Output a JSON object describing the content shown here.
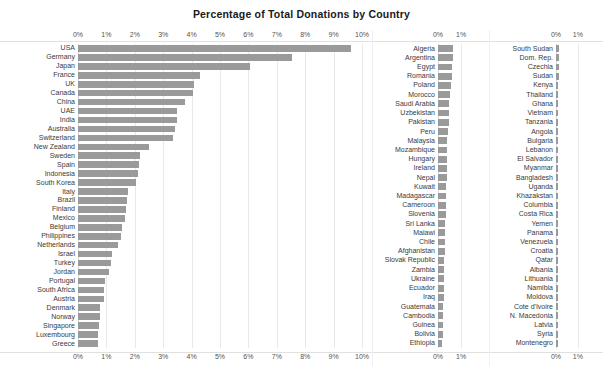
{
  "chart_data": {
    "type": "bar",
    "orientation": "horizontal",
    "title": "Percentage of Total Donations by Country",
    "xlabel": "",
    "ylabel": "",
    "grid": true,
    "legend": null,
    "value_suffix": "%",
    "panels": [
      {
        "name": "panel-left",
        "xlim": [
          0,
          10
        ],
        "ticks": [
          0,
          1,
          2,
          3,
          4,
          5,
          6,
          7,
          8,
          9,
          10
        ],
        "tick_labels": [
          "0%",
          "1%",
          "2%",
          "3%",
          "4%",
          "5%",
          "6%",
          "7%",
          "8%",
          "9%",
          "10%"
        ],
        "categories": [
          "USA",
          "Germany",
          "Japan",
          "France",
          "UK",
          "Canada",
          "China",
          "UAE",
          "India",
          "Australia",
          "Switzerland",
          "New Zealand",
          "Sweden",
          "Spain",
          "Indonesia",
          "South Korea",
          "Italy",
          "Brazil",
          "Finland",
          "Mexico",
          "Belgium",
          "Philippines",
          "Netherlands",
          "Israel",
          "Turkey",
          "Jordan",
          "Portugal",
          "South Africa",
          "Austria",
          "Denmark",
          "Norway",
          "Singapore",
          "Luxembourg",
          "Greece"
        ],
        "values": [
          9.6,
          7.55,
          6.05,
          4.3,
          4.1,
          4.05,
          3.75,
          3.5,
          3.48,
          3.4,
          3.35,
          2.5,
          2.2,
          2.15,
          2.1,
          2.05,
          1.75,
          1.72,
          1.7,
          1.65,
          1.55,
          1.5,
          1.4,
          1.2,
          1.15,
          1.1,
          0.95,
          0.92,
          0.9,
          0.78,
          0.76,
          0.74,
          0.72,
          0.7
        ]
      },
      {
        "name": "panel-middle",
        "xlim": [
          0,
          1.6
        ],
        "ticks": [
          0,
          1
        ],
        "tick_labels": [
          "0%",
          "1%"
        ],
        "categories": [
          "Algeria",
          "Argentina",
          "Egypt",
          "Romania",
          "Poland",
          "Morocco",
          "Saudi Arabia",
          "Uzbekistan",
          "Pakistan",
          "Peru",
          "Malaysia",
          "Mozambique",
          "Hungary",
          "Ireland",
          "Nepal",
          "Kuwait",
          "Madagascar",
          "Cameroon",
          "Slovenia",
          "Sri Lanka",
          "Malawi",
          "Chile",
          "Afghanistan",
          "Slovak Republic",
          "Zambia",
          "Ukraine",
          "Ecuador",
          "Iraq",
          "Guatemala",
          "Cambodia",
          "Guinea",
          "Bolivia",
          "Ethiopia"
        ],
        "values": [
          0.66,
          0.64,
          0.62,
          0.6,
          0.58,
          0.5,
          0.49,
          0.47,
          0.46,
          0.42,
          0.41,
          0.4,
          0.39,
          0.38,
          0.37,
          0.36,
          0.35,
          0.34,
          0.33,
          0.32,
          0.31,
          0.3,
          0.29,
          0.28,
          0.27,
          0.26,
          0.25,
          0.24,
          0.23,
          0.22,
          0.21,
          0.2,
          0.19
        ]
      },
      {
        "name": "panel-right",
        "xlim": [
          0,
          1.6
        ],
        "ticks": [
          0,
          1
        ],
        "tick_labels": [
          "0%",
          "1%"
        ],
        "categories": [
          "South Sudan",
          "Dom. Rep.",
          "Czechia",
          "Sudan",
          "Kenya",
          "Thailand",
          "Ghana",
          "Vietnam",
          "Tanzania",
          "Angola",
          "Bulgaria",
          "Lebanon",
          "El Salvador",
          "Myanmar",
          "Bangladesh",
          "Uganda",
          "Khazakstan",
          "Columbia",
          "Costa Rica",
          "Yemen",
          "Panama",
          "Venezuela",
          "Croatia",
          "Qatar",
          "Albania",
          "Lithuania",
          "Namibia",
          "Moldova",
          "Cote d'Ivoire",
          "N. Macedonia",
          "Latvia",
          "Syria",
          "Montenegro"
        ],
        "values": [
          0.13,
          0.125,
          0.12,
          0.115,
          0.11,
          0.105,
          0.1,
          0.098,
          0.095,
          0.092,
          0.09,
          0.088,
          0.085,
          0.082,
          0.08,
          0.078,
          0.075,
          0.072,
          0.07,
          0.068,
          0.065,
          0.062,
          0.06,
          0.058,
          0.055,
          0.052,
          0.05,
          0.048,
          0.045,
          0.042,
          0.04,
          0.038,
          0.035
        ]
      }
    ]
  },
  "style": {
    "bar_color": "#9a9a9a",
    "grid_color": "#e8e8e8",
    "text_color": "#3a3a3a",
    "title_color": "#1a1a1a",
    "background": "#ffffff"
  }
}
